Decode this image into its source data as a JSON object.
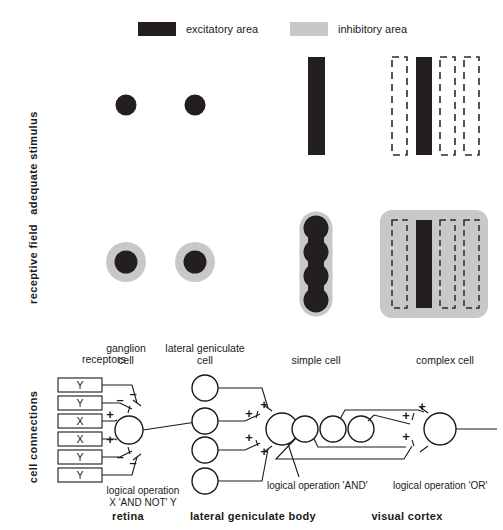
{
  "figure": {
    "title_absent": true,
    "legend": [
      {
        "key": "excitatory",
        "label": "excitatory area",
        "color": "#231f20"
      },
      {
        "key": "inhibitory",
        "label": "inhibitory area",
        "color": "#c8c8c8"
      }
    ],
    "row_labels": [
      {
        "key": "adequate-stimulus",
        "label": "adequate stimulus"
      },
      {
        "key": "receptive-field",
        "label": "receptive field"
      },
      {
        "key": "cell-connections",
        "label": "cell connections"
      }
    ],
    "column_headers": [
      {
        "key": "receptors",
        "label": "receptors"
      },
      {
        "key": "ganglion-cell",
        "line1": "ganglion",
        "line2": "cell"
      },
      {
        "key": "lateral-geniculate-cell",
        "line1": "lateral geniculate",
        "line2": "cell"
      },
      {
        "key": "simple-cell",
        "label": "simple cell"
      },
      {
        "key": "complex-cell",
        "label": "complex cell"
      }
    ],
    "region_labels": [
      {
        "key": "retina",
        "label": "retina"
      },
      {
        "key": "lateral-geniculate-body",
        "label": "lateral  geniculate  body"
      },
      {
        "key": "visual-cortex",
        "label": "visual cortex"
      }
    ],
    "operations": [
      {
        "key": "ganglion-op",
        "line1": "logical operation",
        "line2": "X 'AND NOT' Y"
      },
      {
        "key": "simple-op",
        "label": "logical operation 'AND'"
      },
      {
        "key": "complex-op",
        "label": "logical operation 'OR'"
      }
    ],
    "receptors": [
      {
        "index": 0,
        "label": "Y",
        "sign": "–"
      },
      {
        "index": 1,
        "label": "Y",
        "sign": "–"
      },
      {
        "index": 2,
        "label": "X",
        "sign": "+"
      },
      {
        "index": 3,
        "label": "X",
        "sign": "+"
      },
      {
        "index": 4,
        "label": "Y",
        "sign": "–"
      },
      {
        "index": 5,
        "label": "Y",
        "sign": "–"
      }
    ],
    "lgn_signs": [
      "+",
      "+",
      "+",
      "+"
    ],
    "complex_signs": [
      "+",
      "+",
      "+"
    ],
    "stimuli": {
      "ganglion": {
        "type": "spot",
        "fill": "excitatory"
      },
      "lateral_geniculate": {
        "type": "spot",
        "fill": "excitatory"
      },
      "simple_cell": {
        "type": "bar",
        "fill": "excitatory",
        "count": 1
      },
      "complex_cell": {
        "type": "bars",
        "pattern": [
          "dashed",
          "solid",
          "dashed",
          "dashed"
        ]
      }
    },
    "receptive_fields": {
      "ganglion": {
        "center": "excitatory",
        "surround": "inhibitory"
      },
      "lateral_geniculate": {
        "center": "excitatory",
        "surround": "inhibitory"
      },
      "simple_cell": {
        "shape": "vertical chain of 4 excitatory spots",
        "surround": "inhibitory"
      },
      "complex_cell": {
        "shape": "inhibitory field with one excitatory bar and 3 dashed positions"
      }
    }
  }
}
